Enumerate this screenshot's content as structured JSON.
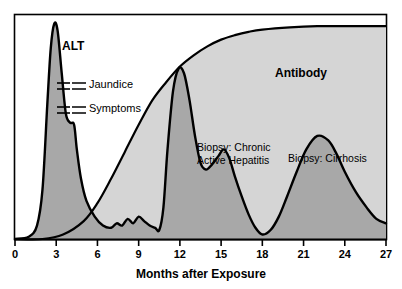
{
  "chart_data": {
    "type": "area",
    "title": "",
    "xlabel": "Months after Exposure",
    "ylabel": "",
    "xlim": [
      0,
      27
    ],
    "ylim": [
      0,
      100
    ],
    "grid": false,
    "legend_position": "inline-labels",
    "x_ticks": [
      "0",
      "3",
      "6",
      "9",
      "12",
      "15",
      "18",
      "21",
      "24",
      "27"
    ],
    "x_tick_values": [
      0,
      3,
      6,
      9,
      12,
      15,
      18,
      21,
      24,
      27
    ],
    "series": [
      {
        "name": "ALT",
        "fill": "#a8a8a8",
        "stroke": "#000000",
        "x": [
          0.0,
          1.0,
          1.6,
          2.0,
          2.35,
          2.6,
          2.85,
          3.1,
          3.4,
          3.7,
          4.0,
          4.3,
          4.5,
          4.8,
          5.2,
          5.8,
          6.4,
          7.0,
          7.4,
          7.8,
          8.2,
          8.6,
          9.0,
          9.4,
          9.8,
          10.2,
          10.5,
          10.8,
          11.1,
          11.5,
          11.9,
          12.3,
          12.7,
          13.1,
          13.5,
          13.9,
          14.3,
          14.8,
          15.2,
          15.6,
          16.0,
          16.5,
          17.0,
          17.5,
          18.0,
          18.6,
          19.2,
          19.8,
          20.5,
          21.2,
          22.0,
          22.8,
          23.4,
          24.0,
          24.8,
          25.6,
          26.3,
          27.0
        ],
        "y": [
          0,
          1,
          6,
          22,
          60,
          85,
          96,
          93,
          74,
          56,
          52,
          51,
          40,
          27,
          17,
          10,
          6,
          5,
          7,
          6,
          9,
          7,
          10,
          8,
          6,
          5,
          4,
          14,
          40,
          66,
          76,
          74,
          62,
          46,
          34,
          31,
          33,
          37,
          40,
          36,
          28,
          19,
          11,
          5,
          2,
          4,
          10,
          19,
          30,
          40,
          46,
          44,
          38,
          30,
          21,
          14,
          9,
          7
        ]
      },
      {
        "name": "Antibody",
        "fill": "#d5d5d5",
        "stroke": "#000000",
        "x": [
          0.0,
          2.0,
          3.5,
          5.0,
          6.0,
          7.0,
          8.0,
          9.0,
          10.0,
          11.0,
          12.0,
          13.0,
          14.0,
          15.0,
          16.0,
          17.0,
          18.0,
          20.0,
          22.0,
          24.0,
          26.0,
          27.0
        ],
        "y": [
          0,
          0,
          2,
          8,
          16,
          27,
          39,
          51,
          62,
          70,
          77,
          82,
          86,
          89,
          91,
          92.5,
          93.5,
          94.5,
          95,
          95,
          95,
          95
        ]
      }
    ],
    "annotations": [
      {
        "id": "alt-label",
        "text": "ALT",
        "x": 3.0,
        "y": 103,
        "style": "series-label"
      },
      {
        "id": "antibody-label",
        "text": "Antibody",
        "x": 20.8,
        "y": 100,
        "style": "series-label"
      },
      {
        "id": "jaundice-label",
        "text": "Jaundice",
        "x": 5.7,
        "y": 80,
        "style": "marker-label"
      },
      {
        "id": "symptoms-label",
        "text": "Symptoms",
        "x": 5.7,
        "y": 65,
        "style": "marker-label"
      },
      {
        "id": "biopsy-chronic-line1",
        "text": "Biopsy: Chronic",
        "x": 13.5,
        "y": 55,
        "style": "annot-label"
      },
      {
        "id": "biopsy-chronic-line2",
        "text": "Active Hepatitis",
        "x": 13.5,
        "y": 49,
        "style": "annot-label"
      },
      {
        "id": "biopsy-cirrhosis",
        "text": "Biopsy: Cirrhosis",
        "x": 20.2,
        "y": 50,
        "style": "annot-label"
      }
    ]
  },
  "figure": {
    "axis_title": "Months after Exposure",
    "alt_label": "ALT",
    "antibody_label": "Antibody",
    "jaundice_label": "Jaundice",
    "symptoms_label": "Symptoms",
    "biopsy_chronic_line1": "Biopsy: Chronic",
    "biopsy_chronic_line2": "Active Hepatitis",
    "biopsy_cirrhosis_label": "Biopsy: Cirrhosis",
    "ticks": {
      "t0": "0",
      "t3": "3",
      "t6": "6",
      "t9": "9",
      "t12": "12",
      "t15": "15",
      "t18": "18",
      "t21": "21",
      "t24": "24",
      "t27": "27"
    }
  },
  "colors": {
    "antibody_fill": "#d5d5d5",
    "alt_fill": "#a8a8a8",
    "outline": "#000000",
    "frame": "#000000",
    "background": "#ffffff"
  }
}
